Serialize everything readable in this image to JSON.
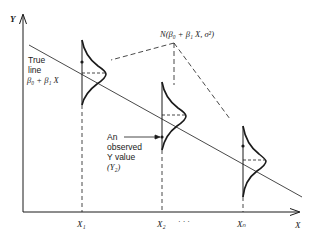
{
  "diagram": {
    "type": "regression-model-illustration",
    "axes": {
      "y_label": "Y",
      "x_label": "X",
      "x_ticks": [
        "X₁",
        "X₂",
        "Xₙ"
      ],
      "x_ellipsis": "· · ·"
    },
    "true_line_label": {
      "line1": "True",
      "line2": "line",
      "line3": "β₀ + β₁ X"
    },
    "distribution_label": "N(β₀ + β₁ X, σ²)",
    "observed_label": {
      "line1": "An",
      "line2": "observed",
      "line3": "Y value",
      "line4": "(Y₂)"
    },
    "colors": {
      "ink": "#1a1a1a",
      "background": "#ffffff"
    }
  }
}
